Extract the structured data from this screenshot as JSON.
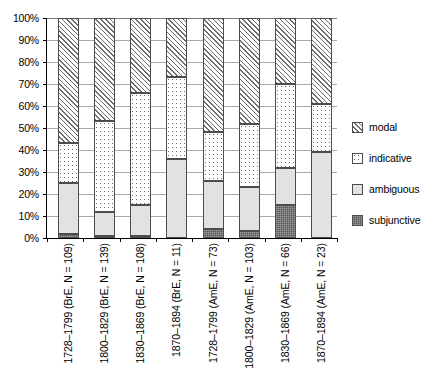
{
  "chart_data": {
    "type": "bar",
    "subtype": "stacked-percentage",
    "title": "",
    "xlabel": "",
    "ylabel": "",
    "ylim": [
      0,
      100
    ],
    "yticks": [
      0,
      10,
      20,
      30,
      40,
      50,
      60,
      70,
      80,
      90,
      100
    ],
    "ytick_labels": [
      "0%",
      "10%",
      "20%",
      "30%",
      "40%",
      "50%",
      "60%",
      "70%",
      "80%",
      "90%",
      "100%"
    ],
    "grid": true,
    "legend_position": "right",
    "categories": [
      "1728–1799 (BrE, N = 109)",
      "1800–1829 (BrE, N = 139)",
      "1830–1869 (BrE, N = 108)",
      "1870–1894 (BrE, N = 11)",
      "1728–1799 (AmE, N = 73)",
      "1800–1829 (AmE, N = 103)",
      "1830–1869 (AmE, N = 66)",
      "1870–1894 (AmE, N = 23)"
    ],
    "series": [
      {
        "name": "subjunctive",
        "color": "#565656",
        "pattern": "dense-dots",
        "values": [
          2,
          1,
          1,
          0,
          4,
          3,
          15,
          0
        ]
      },
      {
        "name": "ambiguous",
        "color": "#e2e2e2",
        "pattern": "solid-light",
        "values": [
          23,
          11,
          14,
          36,
          22,
          20,
          17,
          39
        ]
      },
      {
        "name": "indicative",
        "color": "#ffffff",
        "pattern": "sparse-dots",
        "values": [
          18,
          41,
          51,
          37,
          22,
          29,
          38,
          22
        ]
      },
      {
        "name": "modal",
        "color": "#ffffff",
        "pattern": "diagonal-hatch",
        "values": [
          57,
          47,
          34,
          27,
          52,
          48,
          30,
          39
        ]
      }
    ],
    "cumulative_tops": [
      [
        2,
        25,
        43,
        100
      ],
      [
        1,
        12,
        53,
        100
      ],
      [
        1,
        15,
        66,
        100
      ],
      [
        0,
        36,
        73,
        100
      ],
      [
        4,
        26,
        48,
        100
      ],
      [
        3,
        23,
        52,
        100
      ],
      [
        15,
        32,
        70,
        100
      ],
      [
        0,
        39,
        61,
        100
      ]
    ]
  },
  "legend": {
    "items": [
      {
        "label": "modal",
        "swatch": "modal-swatch"
      },
      {
        "label": "indicative",
        "swatch": "indicative-swatch"
      },
      {
        "label": "ambiguous",
        "swatch": "ambiguous-swatch"
      },
      {
        "label": "subjunctive",
        "swatch": "subjunctive-swatch"
      }
    ]
  }
}
